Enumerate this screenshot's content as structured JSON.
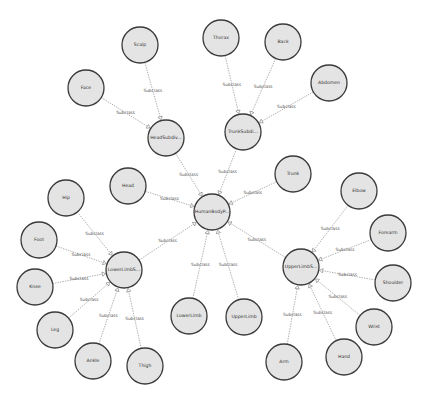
{
  "diagram": {
    "type": "ontology-graph",
    "node_radius": 18,
    "colors": {
      "node_fill": "#e4e4e4",
      "node_stroke": "#3a3a3a",
      "edge": "#8c8c8c",
      "background": "#ffffff"
    },
    "nodes": [
      {
        "id": "HumanBody",
        "label": "HumanBodyP...",
        "x": 212,
        "y": 212
      },
      {
        "id": "HeadSubdiv",
        "label": "HeadSubdiv...",
        "x": 166,
        "y": 138
      },
      {
        "id": "TrunkSubdiv",
        "label": "TrunkSubdi...",
        "x": 243,
        "y": 132
      },
      {
        "id": "LowerLimbSubdiv",
        "label": "LowerLimbS...",
        "x": 124,
        "y": 270
      },
      {
        "id": "UpperLimbSubdiv",
        "label": "UpperLimbS...",
        "x": 301,
        "y": 267
      },
      {
        "id": "Scalp",
        "label": "Scalp",
        "x": 140,
        "y": 45
      },
      {
        "id": "Face",
        "label": "Face",
        "x": 86,
        "y": 88
      },
      {
        "id": "Thorax",
        "label": "Thorax",
        "x": 221,
        "y": 38
      },
      {
        "id": "Back",
        "label": "Back",
        "x": 283,
        "y": 42
      },
      {
        "id": "Abdomen",
        "label": "Abdomen",
        "x": 329,
        "y": 83
      },
      {
        "id": "Head",
        "label": "Head",
        "x": 128,
        "y": 186
      },
      {
        "id": "Trunk",
        "label": "Trunk",
        "x": 293,
        "y": 174
      },
      {
        "id": "Hip",
        "label": "Hip",
        "x": 66,
        "y": 198
      },
      {
        "id": "Foot",
        "label": "Foot",
        "x": 39,
        "y": 240
      },
      {
        "id": "Knee",
        "label": "Knee",
        "x": 35,
        "y": 287
      },
      {
        "id": "Leg",
        "label": "Leg",
        "x": 55,
        "y": 330
      },
      {
        "id": "Ankle",
        "label": "Ankle",
        "x": 93,
        "y": 361
      },
      {
        "id": "Thigh",
        "label": "Thigh",
        "x": 145,
        "y": 366
      },
      {
        "id": "LowerLimb",
        "label": "LowerLimb",
        "x": 189,
        "y": 316
      },
      {
        "id": "UpperLimb",
        "label": "UpperLimb",
        "x": 244,
        "y": 317
      },
      {
        "id": "Elbow",
        "label": "Elbow",
        "x": 359,
        "y": 191
      },
      {
        "id": "Forearm",
        "label": "Forearm",
        "x": 388,
        "y": 233
      },
      {
        "id": "Shoulder",
        "label": "Shoulder",
        "x": 393,
        "y": 283
      },
      {
        "id": "Wrist",
        "label": "Wrist",
        "x": 374,
        "y": 327
      },
      {
        "id": "Hand",
        "label": "Hand",
        "x": 344,
        "y": 357
      },
      {
        "id": "Arm",
        "label": "Arm",
        "x": 284,
        "y": 362
      }
    ],
    "edges": [
      {
        "from": "HeadSubdiv",
        "to": "HumanBody",
        "label": "Subclass"
      },
      {
        "from": "TrunkSubdiv",
        "to": "HumanBody",
        "label": "Subclass"
      },
      {
        "from": "Head",
        "to": "HumanBody",
        "label": "Subclass"
      },
      {
        "from": "Trunk",
        "to": "HumanBody",
        "label": "Subclass"
      },
      {
        "from": "LowerLimbSubdiv",
        "to": "HumanBody",
        "label": "Subclass"
      },
      {
        "from": "UpperLimbSubdiv",
        "to": "HumanBody",
        "label": "Subclass"
      },
      {
        "from": "LowerLimb",
        "to": "HumanBody",
        "label": "Subclass"
      },
      {
        "from": "UpperLimb",
        "to": "HumanBody",
        "label": "Subclass"
      },
      {
        "from": "Scalp",
        "to": "HeadSubdiv",
        "label": "Subclass"
      },
      {
        "from": "Face",
        "to": "HeadSubdiv",
        "label": "Subclass"
      },
      {
        "from": "Thorax",
        "to": "TrunkSubdiv",
        "label": "Subclass"
      },
      {
        "from": "Back",
        "to": "TrunkSubdiv",
        "label": "Subclass"
      },
      {
        "from": "Abdomen",
        "to": "TrunkSubdiv",
        "label": "Subclass"
      },
      {
        "from": "Hip",
        "to": "LowerLimbSubdiv",
        "label": "Subclass"
      },
      {
        "from": "Foot",
        "to": "LowerLimbSubdiv",
        "label": "Subclass"
      },
      {
        "from": "Knee",
        "to": "LowerLimbSubdiv",
        "label": "Subclass"
      },
      {
        "from": "Leg",
        "to": "LowerLimbSubdiv",
        "label": "Subclass"
      },
      {
        "from": "Ankle",
        "to": "LowerLimbSubdiv",
        "label": "Subclass"
      },
      {
        "from": "Thigh",
        "to": "LowerLimbSubdiv",
        "label": "Subclass"
      },
      {
        "from": "Elbow",
        "to": "UpperLimbSubdiv",
        "label": "Subclass"
      },
      {
        "from": "Forearm",
        "to": "UpperLimbSubdiv",
        "label": "Subclass"
      },
      {
        "from": "Shoulder",
        "to": "UpperLimbSubdiv",
        "label": "Subclass"
      },
      {
        "from": "Wrist",
        "to": "UpperLimbSubdiv",
        "label": "Subclass"
      },
      {
        "from": "Hand",
        "to": "UpperLimbSubdiv",
        "label": "Subclass"
      },
      {
        "from": "Arm",
        "to": "UpperLimbSubdiv",
        "label": "Subclass"
      }
    ]
  }
}
